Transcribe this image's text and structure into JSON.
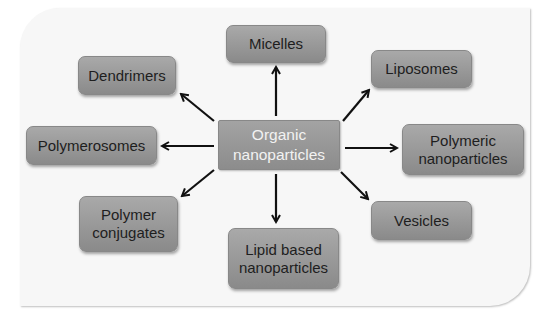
{
  "diagram": {
    "center": {
      "label_line1": "Organic",
      "label_line2": "nanoparticles"
    },
    "nodes": {
      "micelles": {
        "label": "Micelles"
      },
      "dendrimers": {
        "label": "Dendrimers"
      },
      "liposomes": {
        "label": "Liposomes"
      },
      "polymerosomes": {
        "label": "Polymerosomes"
      },
      "polymeric_nanoparticles": {
        "label_line1": "Polymeric",
        "label_line2": "nanoparticles"
      },
      "polymer_conjugates": {
        "label_line1": "Polymer",
        "label_line2": "conjugates"
      },
      "lipid_based_nanoparticles": {
        "label_line1": "Lipid based",
        "label_line2": "nanoparticles"
      },
      "vesicles": {
        "label": "Vesicles"
      }
    },
    "colors": {
      "node_fill": "#9a9a9a",
      "center_text": "#f2f2f2",
      "node_text": "#1e1e1e",
      "arrow": "#111111",
      "panel": "#f7f7f7"
    }
  }
}
